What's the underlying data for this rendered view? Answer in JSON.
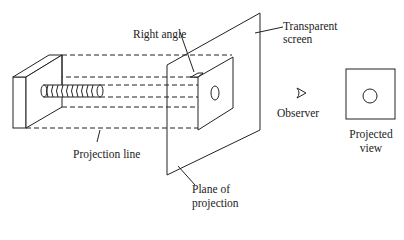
{
  "diagram": {
    "labels": {
      "right_angle": "Right angle",
      "transparent_screen_1": "Transparent",
      "transparent_screen_2": "screen",
      "observer": "Observer",
      "projected_view_1": "Projected",
      "projected_view_2": "view",
      "projection_line": "Projection line",
      "plane_of_projection_1": "Plane of",
      "plane_of_projection_2": "projection"
    },
    "colors": {
      "line": "#222222",
      "background": "#ffffff"
    }
  }
}
